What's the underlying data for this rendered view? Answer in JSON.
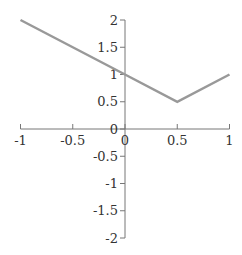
{
  "chart_data": {
    "type": "line",
    "title": "",
    "xlabel": "",
    "ylabel": "",
    "xlim": [
      -1,
      1
    ],
    "ylim": [
      -2,
      2
    ],
    "grid": false,
    "legend": null,
    "x_ticks": [
      "-1",
      "-0.5",
      "0",
      "0.5",
      "1"
    ],
    "y_ticks": [
      "2",
      "1.5",
      "1",
      "0.5",
      "0",
      "-0.5",
      "-1",
      "-1.5",
      "-2"
    ],
    "series": [
      {
        "name": "y = |x - 0.5| + 0.5",
        "color": "#999999",
        "x": [
          -1,
          0,
          0.5,
          1
        ],
        "y": [
          2,
          1,
          0.5,
          1
        ]
      }
    ]
  },
  "colors": {
    "axis": "#777777",
    "line": "#999999",
    "text": "#333333"
  }
}
